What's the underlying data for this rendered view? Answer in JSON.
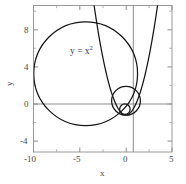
{
  "figure": {
    "background": "#ffffff",
    "curve_color": "#161616",
    "axis_color": "#8d8d8d",
    "frame_color": "#9a9a9a",
    "label_color": "#4a4a4a"
  },
  "annotation": {
    "base": "y = x",
    "exponent": "2",
    "full": "y = x2",
    "x_data": -4.6,
    "y_data": 6.2
  },
  "axis_titles": {
    "x": "x",
    "y": "y"
  },
  "chart_data": {
    "type": "line",
    "title": "",
    "xlabel": "x",
    "ylabel": "y",
    "xlim": [
      -10,
      5
    ],
    "ylim": [
      -4,
      11.8
    ],
    "xticks": [
      -10,
      -5,
      0,
      5
    ],
    "xticklabels": [
      "-10",
      "-5",
      "0",
      "5"
    ],
    "yticks": [
      -4,
      0,
      4,
      8
    ],
    "yticklabels": [
      "-4",
      "0",
      "4",
      "8"
    ],
    "xminorticks": [
      -7.5,
      -2.5,
      2.5
    ],
    "yminorticks": [
      -2,
      2,
      6,
      10
    ],
    "grid": false,
    "legend": null,
    "annotations": [
      {
        "text": "y = x2",
        "x": -4.6,
        "y": 6.2
      }
    ],
    "series": [
      {
        "name": "parabola",
        "type": "line",
        "equation": "y = x^2",
        "x_range": [
          -3.45,
          3.45
        ],
        "color": "#161616"
      },
      {
        "name": "osculating-circle-large",
        "type": "circle",
        "center": [
          -4.35,
          4.45
        ],
        "radius": 5.62,
        "tangent_point": [
          0.5,
          0.25
        ],
        "color": "#161616"
      },
      {
        "name": "osculating-circle-medium",
        "type": "circle",
        "center": [
          0.02,
          1.52
        ],
        "radius": 1.56,
        "tangent_point": [
          0.85,
          0.72
        ],
        "color": "#161616"
      },
      {
        "name": "osculating-circle-small",
        "type": "circle",
        "center": [
          -0.1,
          0.62
        ],
        "radius": 0.57,
        "tangent_point": [
          0.25,
          0.06
        ],
        "color": "#161616"
      }
    ]
  }
}
